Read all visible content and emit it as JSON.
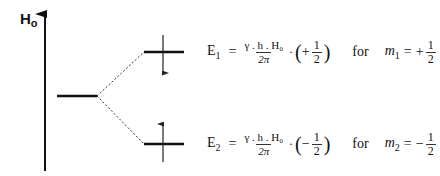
{
  "axis": {
    "label": "H",
    "subscript": "o"
  },
  "levels": {
    "upper": {
      "energy_label": "E",
      "energy_index": "1",
      "numerator": "γ . h . H₀",
      "denominator": "2π",
      "sign": "+",
      "half_num": "1",
      "half_den": "2",
      "for_text": "for",
      "m_label": "m",
      "m_index": "1",
      "m_sign": "+",
      "m_num": "1",
      "m_den": "2",
      "spin": "down"
    },
    "lower": {
      "energy_label": "E",
      "energy_index": "2",
      "numerator": "γ . h . H₀",
      "denominator": "2π",
      "sign": "−",
      "half_num": "1",
      "half_den": "2",
      "for_text": "for",
      "m_label": "m",
      "m_index": "2",
      "m_sign": "−",
      "m_num": "1",
      "m_den": "2",
      "spin": "up"
    }
  },
  "symbols": {
    "equals": "=",
    "dot": "·",
    "open_paren": "(",
    "close_paren": ")"
  }
}
